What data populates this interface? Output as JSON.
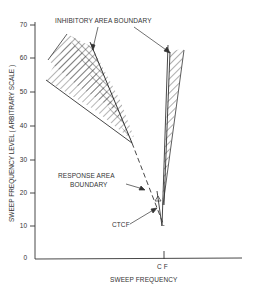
{
  "figure": {
    "annotations": {
      "inhibitory": "INHIBITORY AREA BOUNDARY",
      "response_line1": "RESPONSE AREA",
      "response_line2": "BOUNDARY",
      "ctcf": "CTCF",
      "cf": "C F"
    },
    "axes": {
      "xlabel": "SWEEP FREQUENCY",
      "ylabel": "SWEEP FREQUENCY LEVEL ( ARBITRARY SCALE )",
      "yticks": [
        "70",
        "60",
        "50",
        "40",
        "30",
        "20",
        "10",
        "0"
      ]
    }
  }
}
